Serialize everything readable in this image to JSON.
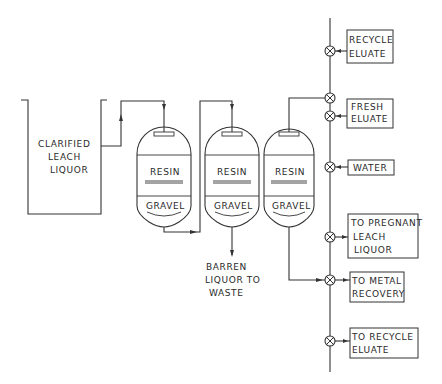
{
  "diagram": {
    "type": "process flow diagram",
    "tank": {
      "label_lines": [
        "CLARIFIED",
        "LEACH",
        "LIQUOR"
      ]
    },
    "columns": [
      {
        "id": 1,
        "resin_label": "RESIN",
        "gravel_label": "GRAVEL"
      },
      {
        "id": 2,
        "resin_label": "RESIN",
        "gravel_label": "GRAVEL"
      },
      {
        "id": 3,
        "resin_label": "RESIN",
        "gravel_label": "GRAVEL"
      }
    ],
    "waste_label_lines": [
      "BARREN",
      "LIQUOR TO",
      "WASTE"
    ],
    "manifold_boxes": [
      {
        "id": "recycle-eluate",
        "label_lines": [
          "RECYCLE",
          "ELUATE"
        ]
      },
      {
        "id": "fresh-eluate",
        "label_lines": [
          "FRESH",
          "ELUATE"
        ]
      },
      {
        "id": "water",
        "label_lines": [
          "WATER"
        ]
      },
      {
        "id": "to-pregnant-leach-liquor",
        "label_lines": [
          "TO PREGNANT",
          "LEACH",
          "LIQUOR"
        ]
      },
      {
        "id": "to-metal-recovery",
        "label_lines": [
          "TO METAL",
          "RECOVERY"
        ]
      },
      {
        "id": "to-recycle-eluate",
        "label_lines": [
          "TO RECYCLE",
          "ELUATE"
        ]
      }
    ],
    "valve_count": 7,
    "valve_symbol": "circle-with-x"
  }
}
